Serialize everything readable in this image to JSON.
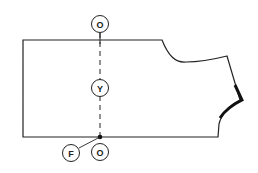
{
  "diagram": {
    "type": "sewing-pattern-piece",
    "colors": {
      "line": "#222222",
      "background": "#ffffff"
    },
    "labels": {
      "top_marker": "O",
      "middle_marker": "Y",
      "bottom_marker": "O",
      "fold_marker": "F"
    }
  }
}
